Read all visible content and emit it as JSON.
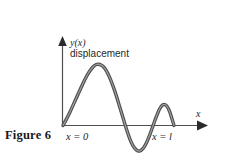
{
  "figure": {
    "caption": "Figure 6",
    "background_color": "#ffffff",
    "curve_color": "#4a4a4a",
    "axis_color": "#4f4f4f",
    "text_color": "#1f1f1f"
  },
  "labels": {
    "y_axis_symbol": "y(x)",
    "y_axis_description": "displacement",
    "x_axis_symbol": "x",
    "x_origin": "x = 0",
    "x_end": "x = l"
  },
  "chart_data": {
    "type": "line",
    "title": "Figure 6",
    "xlabel": "x",
    "ylabel": "y(x) displacement",
    "grid": false,
    "legend": null,
    "annotations": [
      {
        "text": "x = 0",
        "x": 0.0,
        "y": 0.0,
        "position": "below-axis-left"
      },
      {
        "text": "x = l",
        "x": 1.0,
        "y": 0.0,
        "position": "below-axis-right"
      },
      {
        "text": "y(x)",
        "x": 0.0,
        "y": 1.15,
        "position": "above-y-axis"
      },
      {
        "text": "displacement",
        "x": 0.03,
        "y": 1.02,
        "position": "below-y-symbol"
      },
      {
        "text": "x",
        "x": 1.28,
        "y": 0.1,
        "position": "above-x-arrow"
      }
    ],
    "xlim": [
      0,
      1.3
    ],
    "ylim": [
      -0.45,
      1.25
    ],
    "series": [
      {
        "name": "y(x) displacement",
        "x": [
          0.0,
          0.03,
          0.06,
          0.09,
          0.12,
          0.15,
          0.18,
          0.21,
          0.24,
          0.27,
          0.3,
          0.33,
          0.36,
          0.39,
          0.42,
          0.45,
          0.48,
          0.51,
          0.54,
          0.57,
          0.6,
          0.63,
          0.66,
          0.69,
          0.72,
          0.75,
          0.78,
          0.81,
          0.84,
          0.87,
          0.9,
          0.93,
          0.96,
          1.0
        ],
        "y": [
          0.0,
          0.1,
          0.21,
          0.33,
          0.45,
          0.57,
          0.69,
          0.8,
          0.89,
          0.96,
          1.0,
          1.0,
          0.97,
          0.9,
          0.79,
          0.65,
          0.49,
          0.31,
          0.13,
          -0.05,
          -0.21,
          -0.33,
          -0.4,
          -0.42,
          -0.38,
          -0.29,
          -0.16,
          -0.01,
          0.14,
          0.27,
          0.34,
          0.33,
          0.23,
          0.0
        ]
      }
    ]
  }
}
